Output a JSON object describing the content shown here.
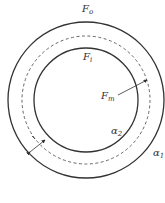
{
  "diagram": {
    "labels": {
      "outer": "F",
      "outer_sub": "o",
      "inner": "F",
      "inner_sub": "i",
      "mid": "F",
      "mid_sub": "m",
      "alpha2": "α",
      "alpha2_sub": "2",
      "alpha1": "α",
      "alpha1_sub": "1"
    },
    "circles": {
      "outer": {
        "cx": 86,
        "cy": 100,
        "r": 78,
        "style": "solid"
      },
      "middle": {
        "cx": 86,
        "cy": 100,
        "r": 64,
        "style": "dashed"
      },
      "inner": {
        "cx": 86,
        "cy": 100,
        "r": 52,
        "style": "solid"
      }
    },
    "colors": {
      "stroke": "#333333",
      "background": "#ffffff"
    }
  }
}
